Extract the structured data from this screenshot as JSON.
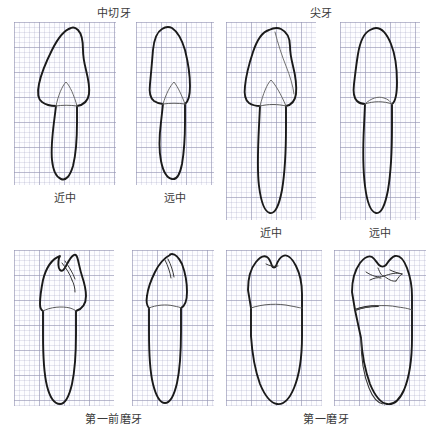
{
  "figure": {
    "groups": [
      {
        "id": "central-incisor",
        "title": "中切牙",
        "views": [
          {
            "id": "ci-mesial",
            "caption": "近中"
          },
          {
            "id": "ci-distal",
            "caption": "远中"
          }
        ]
      },
      {
        "id": "canine",
        "title": "尖牙",
        "views": [
          {
            "id": "c-mesial",
            "caption": "近中"
          },
          {
            "id": "c-distal",
            "caption": "远中"
          }
        ]
      },
      {
        "id": "first-premolar",
        "title": "第一前磨牙",
        "views": [
          {
            "id": "pm-mesial",
            "caption": ""
          },
          {
            "id": "pm-distal",
            "caption": ""
          }
        ]
      },
      {
        "id": "first-molar",
        "title": "第一磨牙",
        "views": [
          {
            "id": "m-mesial",
            "caption": ""
          },
          {
            "id": "m-distal",
            "caption": ""
          }
        ]
      }
    ]
  },
  "colors": {
    "outline": "#1a1a1a",
    "cej_line": "#5a5a5a",
    "grid_minor": "#afafcd",
    "grid_major": "#9696b4",
    "panel_background": "#fdfdff",
    "page_background": "#ffffff",
    "text": "#3a3a3a"
  }
}
